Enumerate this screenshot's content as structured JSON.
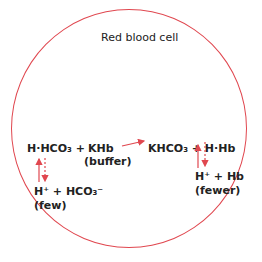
{
  "title": "Red blood cell",
  "reaction": {
    "left_acid": "H·HCO₃ +",
    "left_buffer": "KHb",
    "buffer_label": "(buffer)",
    "right_products": "KHCO₃ + H·Hb",
    "left_dissoc": "H⁺ + HCO₃⁻",
    "left_dissoc_label": "(few)",
    "right_dissoc": "H⁺ + Hb",
    "right_dissoc_label": "(fewer)"
  },
  "colors": {
    "membrane": "#e0474f",
    "arrow": "#e0474f",
    "text": "#222222"
  }
}
